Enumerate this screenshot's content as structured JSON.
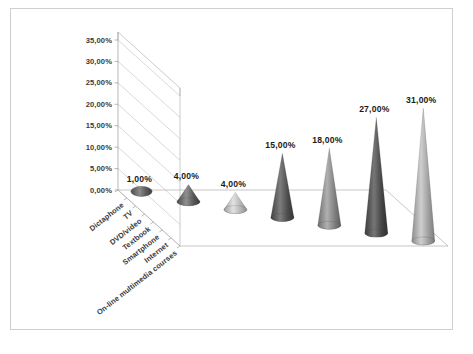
{
  "chart_data": {
    "type": "bar",
    "subtype": "3d-cone",
    "title": "",
    "subtitle": "",
    "xlabel": "",
    "ylabel": "",
    "categories": [
      "Dictaphone",
      "TV",
      "DVD/video",
      "Textbook",
      "Smartphone",
      "Internet",
      "On-line multimedia courses"
    ],
    "values": [
      1,
      4,
      4,
      15,
      18,
      27,
      31
    ],
    "data_labels": [
      "1,00%",
      "4,00%",
      "4,00%",
      "15,00%",
      "18,00%",
      "27,00%",
      "31,00%"
    ],
    "ylim": [
      0,
      35
    ],
    "ytick_values": [
      0,
      5,
      10,
      15,
      20,
      25,
      30,
      35
    ],
    "ytick_labels": [
      "0,00%",
      "5,00%",
      "10,00%",
      "15,00%",
      "20,00%",
      "25,00%",
      "30,00%",
      "35,00%"
    ],
    "decimal_separator": ",",
    "units": "percent",
    "grid": true,
    "legend": false,
    "legend_position": "none",
    "series": [
      {
        "name": "Share",
        "values": [
          1,
          4,
          4,
          15,
          18,
          27,
          31
        ],
        "colors": [
          "#6e6e6e",
          "#6a6a6a",
          "#bdbdbd",
          "#5e5e5e",
          "#8d8d8d",
          "#555555",
          "#a9a9a9"
        ]
      }
    ]
  },
  "figure": {
    "caption": "",
    "border_color": "#cfcfcf",
    "background": "#ffffff",
    "grid_color": "#b9b9b9",
    "axis_color": "#9a9a9a",
    "text_color": "#3a3a3a"
  }
}
